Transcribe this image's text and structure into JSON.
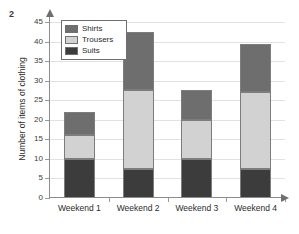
{
  "question_number": "2",
  "chart_data": {
    "type": "bar",
    "subtype": "stacked-bar",
    "title": "",
    "xlabel": "",
    "ylabel": "Number of items of clothing",
    "ylim": [
      0,
      45
    ],
    "ytick_step": 5,
    "yticks": [
      0,
      5,
      10,
      15,
      20,
      25,
      30,
      35,
      40,
      45
    ],
    "ytick_labels": [
      "0",
      "5",
      "10",
      "15",
      "20",
      "25",
      "30",
      "35",
      "40",
      "45"
    ],
    "grid": true,
    "grid_axis": "y",
    "legend_position": "upper left",
    "categories": [
      "Weekend 1",
      "Weekend 2",
      "Weekend 3",
      "Weekend 4"
    ],
    "series": [
      {
        "name": "Suits",
        "color": "#3c3c3c",
        "values": [
          10,
          7.5,
          10,
          7.5
        ]
      },
      {
        "name": "Trousers",
        "color": "#d2d2d2",
        "values": [
          6,
          20,
          10,
          19.5
        ]
      },
      {
        "name": "Shirts",
        "color": "#6e6e6e",
        "values": [
          6,
          15,
          7.5,
          12.5
        ]
      }
    ],
    "stack_order_top_to_bottom": [
      "Shirts",
      "Trousers",
      "Suits"
    ],
    "totals": [
      22,
      42.5,
      27.5,
      39.5
    ],
    "segment_boundaries": {
      "Weekend 1": [
        0,
        10,
        16,
        22
      ],
      "Weekend 2": [
        0,
        7.5,
        27.5,
        42.5
      ],
      "Weekend 3": [
        0,
        10,
        20,
        27.5
      ],
      "Weekend 4": [
        0,
        7.5,
        27,
        39.5
      ]
    }
  },
  "legend": {
    "entries": [
      {
        "label": "Shirts",
        "color": "#6e6e6e"
      },
      {
        "label": "Trousers",
        "color": "#d2d2d2"
      },
      {
        "label": "Suits",
        "color": "#3c3c3c"
      }
    ]
  },
  "axis": {
    "y_title": "Number of items of clothing"
  },
  "colors": {
    "shirts": "#6e6e6e",
    "trousers": "#d2d2d2",
    "suits": "#3c3c3c",
    "axis": "#8c8c8c",
    "grid": "#e2e2e2",
    "text": "#2b2b2b",
    "background": "#ffffff"
  }
}
